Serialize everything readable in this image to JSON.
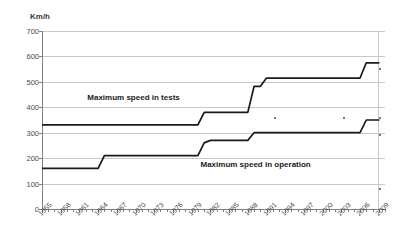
{
  "chart_data": {
    "type": "line",
    "title": "",
    "xlabel": "",
    "ylabel": "Km/h",
    "y_unit_label": "Km/h",
    "ylim": [
      0,
      700
    ],
    "ytick_step": 100,
    "ytick_labels": [
      "700",
      "600",
      "500",
      "400",
      "300",
      "200",
      "100",
      "0"
    ],
    "ytick_values": [
      700,
      600,
      500,
      400,
      300,
      200,
      100,
      0
    ],
    "xlim": [
      1955,
      2010
    ],
    "xtick_labels": [
      "1955",
      "1958",
      "1961",
      "1964",
      "1967",
      "1970",
      "1973",
      "1976",
      "1979",
      "1982",
      "1985",
      "1988",
      "1991",
      "1994",
      "1997",
      "2000",
      "2003",
      "2006",
      "2009"
    ],
    "xtick_values": [
      1955,
      1958,
      1961,
      1964,
      1967,
      1970,
      1973,
      1976,
      1979,
      1982,
      1985,
      1988,
      1991,
      1994,
      1997,
      2000,
      2003,
      2006,
      2009
    ],
    "grid": true,
    "legend_position": "inline-annotation",
    "line_color": "#1a1a1a",
    "grid_color": "#c8c8c8",
    "axis_color": "#808080",
    "series": [
      {
        "name": "Maximum speed in tests",
        "label_text": "Maximum speed in tests",
        "x": [
          1955,
          1980,
          1981,
          1988,
          1989,
          1990,
          1991,
          2006,
          2007,
          2009
        ],
        "values": [
          331,
          331,
          380,
          380,
          482,
          482,
          515,
          515,
          575,
          575
        ]
      },
      {
        "name": "Maximum speed in operation",
        "label_text": "Maximum speed in operation",
        "x": [
          1955,
          1964,
          1965,
          1980,
          1981,
          1982,
          1988,
          1989,
          2006,
          2007,
          2009
        ],
        "values": [
          160,
          160,
          210,
          210,
          260,
          270,
          270,
          300,
          300,
          350,
          350
        ]
      }
    ],
    "annotations": [
      {
        "text": "Maximum speed in tests",
        "x": 1969,
        "y": 437
      },
      {
        "text": "Maximum speed in operation",
        "x": 1991,
        "y": 175
      }
    ]
  }
}
